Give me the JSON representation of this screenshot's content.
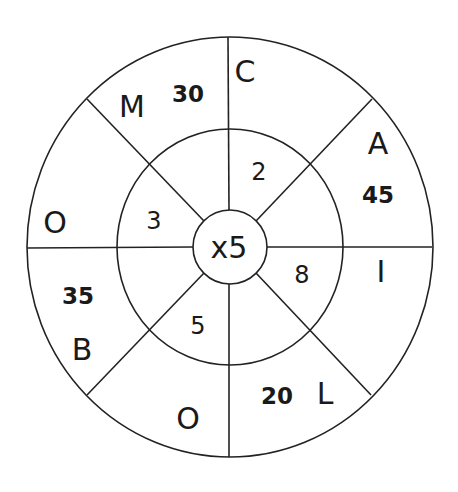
{
  "diagram": {
    "center": {
      "label": "x5"
    },
    "inner_ring_numbers": [
      {
        "id": "inner-top-right",
        "value": "2"
      },
      {
        "id": "inner-right-bottom",
        "value": "8"
      },
      {
        "id": "inner-bottom-left",
        "value": "5"
      },
      {
        "id": "inner-left-top",
        "value": "3"
      }
    ],
    "outer_ring": {
      "letters": [
        {
          "id": "letter-c",
          "value": "C"
        },
        {
          "id": "letter-a",
          "value": "A"
        },
        {
          "id": "letter-i",
          "value": "I"
        },
        {
          "id": "letter-l",
          "value": "L"
        },
        {
          "id": "letter-o-bottom",
          "value": "O"
        },
        {
          "id": "letter-b",
          "value": "B"
        },
        {
          "id": "letter-o-left",
          "value": "O"
        },
        {
          "id": "letter-m",
          "value": "M"
        }
      ],
      "scores": [
        {
          "id": "score-30",
          "value": "30"
        },
        {
          "id": "score-45",
          "value": "45"
        },
        {
          "id": "score-20",
          "value": "20"
        },
        {
          "id": "score-35",
          "value": "35"
        }
      ]
    },
    "colors": {
      "line": "#222222",
      "text": "#1a1a1a",
      "background": "#ffffff"
    }
  }
}
